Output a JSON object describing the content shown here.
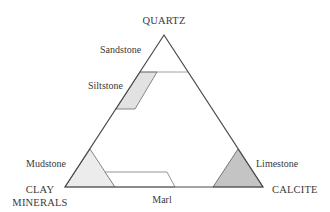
{
  "diagram": {
    "type": "ternary",
    "vertices": {
      "top": "QUARTZ",
      "bottom_left_line1": "CLAY",
      "bottom_left_line2": "MINERALS",
      "bottom_right": "CALCITE"
    },
    "regions": {
      "sandstone": "Sandstone",
      "siltstone": "Siltstone",
      "mudstone": "Mudstone",
      "marl": "Marl",
      "limestone": "Limestone"
    },
    "colors": {
      "outline": "#4a4a4a",
      "siltstone_fill": "#e2e2e2",
      "mudstone_fill": "#ececec",
      "marl_fill": "#ffffff",
      "limestone_fill": "#c4c4c4",
      "text": "#3a3a3a"
    }
  }
}
